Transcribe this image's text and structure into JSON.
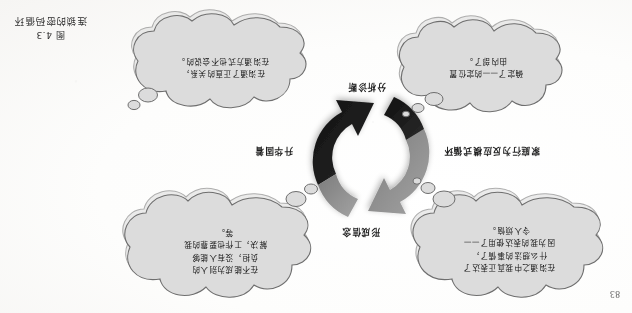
{
  "page": {
    "page_number": "83",
    "background_color": "#fbfaf8",
    "orientation_note": "upside-down-scan"
  },
  "figure": {
    "label": "图 4.3",
    "title": "连锁的密码循环",
    "caption_color": "#2e2e2e"
  },
  "cycle": {
    "arrow_gray": "#8f8f8f",
    "arrow_black": "#1a1a1a",
    "labels": {
      "top": "形成信念",
      "right": "升华固着",
      "bottom": "分析诊断",
      "left": "家庭行为反应模式循环"
    }
  },
  "bubbles": [
    {
      "id": "top-left",
      "position": "top-left",
      "text": "在沟通之中我真正表达了\n什么想法的事情了，\n因为我的表达使用了——\n令人烦恼。",
      "fill": "#dcdcdc",
      "stroke": "#6e6e6e"
    },
    {
      "id": "top-right",
      "position": "top-right",
      "text": "在不能成为别人的\n负担，没有人能够\n解决，工作也要靠的我\n等。",
      "fill": "#dcdcdc",
      "stroke": "#6e6e6e"
    },
    {
      "id": "bottom-left",
      "position": "bottom-left",
      "text": "确定了——的定位置\n由内部了。",
      "fill": "#dcdcdc",
      "stroke": "#6e6e6e"
    },
    {
      "id": "bottom-right",
      "position": "bottom-right",
      "text": "在沟通了正直的关系，\n在沟通方式也不会说的。",
      "fill": "#dcdcdc",
      "stroke": "#6e6e6e"
    }
  ]
}
